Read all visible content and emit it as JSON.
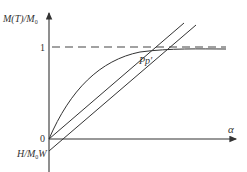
{
  "diagram": {
    "y_axis_label": "M(T)/M",
    "y_axis_label_sub": "0",
    "x_axis_label": "α",
    "lower_label": "H/M",
    "lower_label_sub": "0",
    "lower_label_tail": "W",
    "tick_one": "1",
    "tick_zero": "0",
    "intersection_label": "Pp′",
    "colors": {
      "line": "#333333",
      "dash": "#444444"
    }
  }
}
